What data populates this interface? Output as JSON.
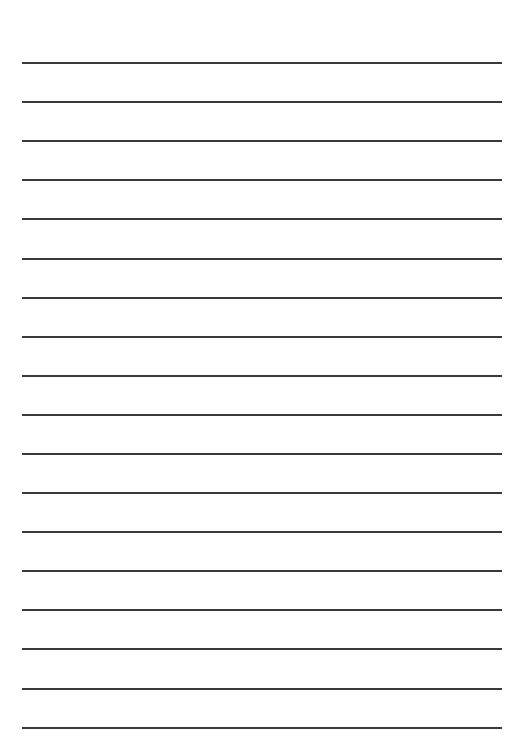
{
  "page": {
    "type": "lined-paper",
    "background_color": "#ffffff",
    "line_color": "#3a3a3a",
    "line_count": 18,
    "line_left": 22,
    "line_right": 502,
    "line_positions": [
      62,
      101,
      140,
      179,
      218,
      258,
      297,
      336,
      375,
      414,
      453,
      492,
      531,
      570,
      609,
      648,
      688,
      727
    ]
  }
}
